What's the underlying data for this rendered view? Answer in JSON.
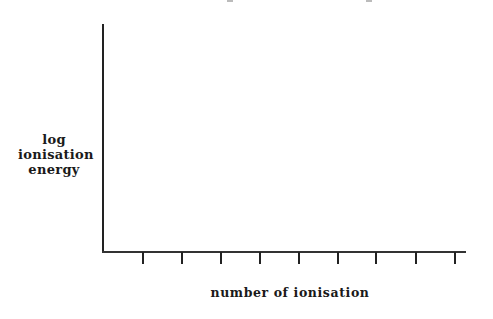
{
  "chart_data": {
    "type": "line",
    "title": "",
    "xlabel": "number of ionisation",
    "ylabel": [
      "log",
      "ionisation",
      "energy"
    ],
    "x_ticks_count": 9,
    "x_tick_labels": [],
    "y_tick_labels": [],
    "series": [],
    "grid": false,
    "legend": null
  },
  "axes": {
    "tick_positions_px": [
      143,
      182,
      221,
      260,
      299,
      338,
      376,
      416,
      455
    ]
  }
}
